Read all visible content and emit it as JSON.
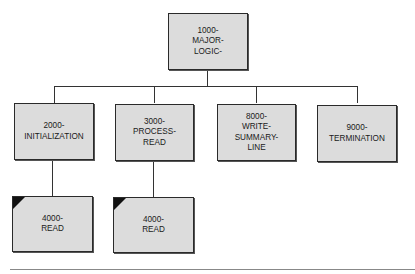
{
  "diagram": {
    "type": "hierarchy-chart",
    "root": {
      "id": "1000",
      "label": "1000-\nMAJOR-\nLOGIC-"
    },
    "level2": [
      {
        "id": "2000",
        "label": "2000-\nINITIALIZATION"
      },
      {
        "id": "3000",
        "label": "3000-\nPROCESS-\nREAD"
      },
      {
        "id": "8000",
        "label": "8000-\nWRITE-\nSUMMARY-\nLINE"
      },
      {
        "id": "9000",
        "label": "9000-\nTERMINATION"
      }
    ],
    "level3": [
      {
        "id": "4000a",
        "parent": "2000",
        "label": "4000-\nREAD",
        "marker": "shaded-corner"
      },
      {
        "id": "4000b",
        "parent": "3000",
        "label": "4000-\nREAD",
        "marker": "shaded-corner"
      }
    ],
    "colors": {
      "box_fill": "#dcdcdc",
      "border": "#2a2a2a",
      "corner": "#111111",
      "rule": "#888888"
    }
  }
}
